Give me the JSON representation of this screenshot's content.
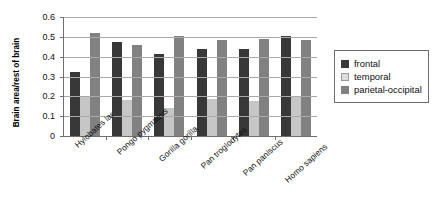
{
  "chart_data": {
    "type": "bar",
    "title": "",
    "xlabel": "",
    "ylabel": "Brain area/rest of brain",
    "ylim": [
      0,
      0.6
    ],
    "ytick_labels": [
      "0.6",
      "0.5",
      "0.4",
      "0.3",
      "0.2",
      "0.1",
      "0"
    ],
    "ytick_values": [
      0.6,
      0.5,
      0.4,
      0.3,
      0.2,
      0.1,
      0
    ],
    "grid": true,
    "legend_position": "right",
    "categories": [
      "Hylobates lar",
      "Pongo pygmaeus",
      "Gorilla gorilla",
      "Pan troglodytes",
      "Pan paniscus",
      "Homo sapiens"
    ],
    "series": [
      {
        "name": "frontal",
        "color": "#383838",
        "values": [
          0.325,
          0.475,
          0.415,
          0.44,
          0.44,
          0.505
        ]
      },
      {
        "name": "temporal",
        "color": "#c6c6c6",
        "values": [
          0.2,
          0.18,
          0.14,
          0.185,
          0.175,
          0.195
        ]
      },
      {
        "name": "parietal-occipital",
        "color": "#818181",
        "values": [
          0.52,
          0.46,
          0.505,
          0.485,
          0.49,
          0.485
        ]
      }
    ]
  },
  "legend": {
    "items": [
      {
        "label": "frontal",
        "swatch": "frontal"
      },
      {
        "label": "temporal",
        "swatch": "temporal"
      },
      {
        "label": "parietal-occipital",
        "swatch": "parietal"
      }
    ]
  }
}
